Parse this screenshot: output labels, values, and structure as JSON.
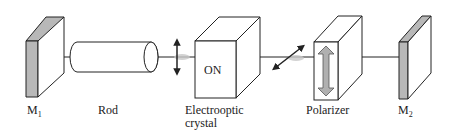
{
  "diagram": {
    "components": [
      {
        "id": "m1",
        "label": "M",
        "subscript": "1"
      },
      {
        "id": "rod",
        "label": "Rod"
      },
      {
        "id": "crystal",
        "label": "Electrooptic crystal",
        "label_line1": "Electrooptic",
        "label_line2": "crystal",
        "state_text": "ON"
      },
      {
        "id": "polarizer",
        "label": "Polarizer"
      },
      {
        "id": "m2",
        "label": "M",
        "subscript": "2"
      }
    ],
    "annotations": {
      "polarization_after_rod": "vertical",
      "polarization_after_crystal": "diagonal",
      "polarizer_axis": "vertical"
    },
    "colors": {
      "mirror_fill": "#b8b8b8",
      "polarizer_arrow": "#b0b0b0",
      "line": "#222222",
      "beam_glow": "#c8c8c8"
    }
  }
}
